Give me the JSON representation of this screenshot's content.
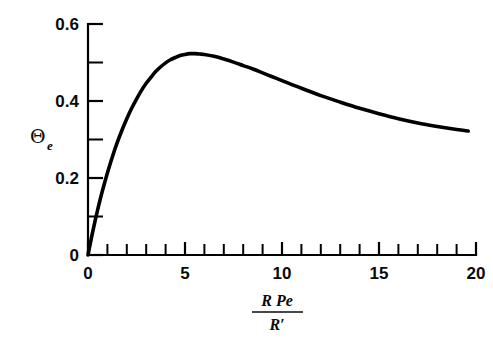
{
  "chart_data": {
    "type": "line",
    "title": "",
    "xlabel": "R Pe / R'",
    "xlabel_numerator": "R Pe",
    "xlabel_denominator": "R′",
    "ylabel": "Θe",
    "ylabel_symbol": "Θ",
    "ylabel_subscript": "e",
    "xlim": [
      0,
      20
    ],
    "ylim": [
      0,
      0.6
    ],
    "grid": false,
    "legend": false,
    "x_major_ticks": [
      0,
      5,
      10,
      15,
      20
    ],
    "x_major_tick_labels": [
      "0",
      "5",
      "10",
      "15",
      "20"
    ],
    "x_minor_tick_interval": 1,
    "y_major_ticks": [
      0,
      0.2,
      0.4,
      0.6
    ],
    "y_major_tick_labels": [
      "0",
      "0.2",
      "0.4",
      "0.6"
    ],
    "y_minor_ticks": [
      0.1,
      0.3,
      0.5
    ],
    "line_color": "#000000",
    "background_color": "#ffffff",
    "series": [
      {
        "name": "Θe",
        "x": [
          0.0,
          0.25,
          0.5,
          0.75,
          1.0,
          1.25,
          1.5,
          1.75,
          2.0,
          2.25,
          2.5,
          2.75,
          3.0,
          3.25,
          3.5,
          3.75,
          4.0,
          4.25,
          4.5,
          4.75,
          5.0,
          5.25,
          5.5,
          5.75,
          6.0,
          6.5,
          7.0,
          7.5,
          8.0,
          8.5,
          9.0,
          9.5,
          10.0,
          11.0,
          12.0,
          13.0,
          14.0,
          15.0,
          16.0,
          17.0,
          18.0,
          19.0,
          19.6
        ],
        "y": [
          0.0,
          0.062,
          0.118,
          0.168,
          0.213,
          0.254,
          0.291,
          0.324,
          0.354,
          0.381,
          0.405,
          0.427,
          0.446,
          0.462,
          0.477,
          0.489,
          0.499,
          0.507,
          0.513,
          0.518,
          0.521,
          0.523,
          0.523,
          0.522,
          0.521,
          0.516,
          0.509,
          0.501,
          0.492,
          0.483,
          0.473,
          0.463,
          0.453,
          0.433,
          0.414,
          0.397,
          0.381,
          0.367,
          0.354,
          0.343,
          0.334,
          0.326,
          0.322
        ]
      }
    ],
    "peak": {
      "x": 5.4,
      "y": 0.523
    },
    "endpoint": {
      "x": 19.6,
      "y": 0.322
    }
  },
  "axes": {
    "y_axis_name": "theta-e-axis",
    "x_axis_name": "r-pe-over-r-prime-axis"
  }
}
